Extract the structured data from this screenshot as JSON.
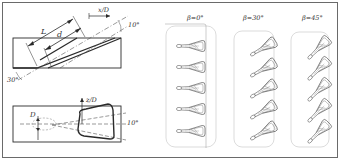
{
  "figure": {
    "side_view": {
      "labels": {
        "length_L": "L",
        "length_d": "d",
        "axis_x": "x/D",
        "lateral_angle": "10°",
        "inclination_angle": "30°"
      }
    },
    "top_view": {
      "labels": {
        "diameter": "D",
        "axis_z": "z/D",
        "expansion_angle": "10°"
      }
    },
    "hole_arrays": [
      {
        "label": "β=0°",
        "angle_deg": 0,
        "hole_count": 5
      },
      {
        "label": "β=30°",
        "angle_deg": 30,
        "hole_count": 5
      },
      {
        "label": "β=45°",
        "angle_deg": 45,
        "hole_count": 5
      }
    ]
  },
  "colors": {
    "line": "#2a2a2a",
    "frame": "#6a6a6a",
    "dashed": "#555555",
    "plate_outline": "#bdbdbd"
  }
}
